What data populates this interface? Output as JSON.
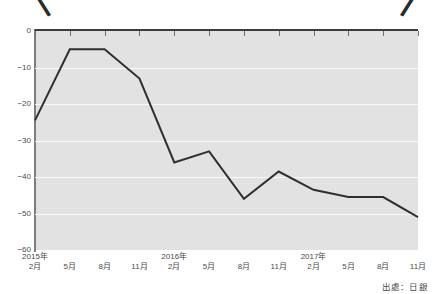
{
  "title_fragment": {
    "left_bracket": "〈",
    "right_bracket": "〉"
  },
  "source_note": "出處：日銀",
  "chart_data": {
    "type": "line",
    "title": "",
    "xlabel": "",
    "ylabel": "",
    "ylim": [
      -60,
      0
    ],
    "yticks": [
      0,
      -10,
      -20,
      -30,
      -40,
      -50,
      -60
    ],
    "ytick_labels": [
      "0",
      "−10",
      "−20",
      "−30",
      "−40",
      "−50",
      "−60"
    ],
    "grid": true,
    "grid_color": "#fafafa",
    "plot_background": "#e2e2e2",
    "line_color": "#2f2f2f",
    "legend": null,
    "categories": [
      "2015年2月",
      "5月",
      "8月",
      "11月",
      "2016年2月",
      "5月",
      "8月",
      "11月",
      "2017年2月",
      "5月",
      "8月",
      "11月"
    ],
    "xtick_labels": [
      {
        "year": "2015年",
        "month": "2月"
      },
      {
        "year": "",
        "month": "5月"
      },
      {
        "year": "",
        "month": "8月"
      },
      {
        "year": "",
        "month": "11月"
      },
      {
        "year": "2016年",
        "month": "2月"
      },
      {
        "year": "",
        "month": "5月"
      },
      {
        "year": "",
        "month": "8月"
      },
      {
        "year": "",
        "month": "11月"
      },
      {
        "year": "2017年",
        "month": "2月"
      },
      {
        "year": "",
        "month": "5月"
      },
      {
        "year": "",
        "month": "8月"
      },
      {
        "year": "",
        "month": "11月"
      }
    ],
    "values": [
      -24.5,
      -5,
      -5,
      -13,
      -36,
      -33,
      -46,
      -38.5,
      -43.5,
      -45.5,
      -45.5,
      -51
    ]
  }
}
